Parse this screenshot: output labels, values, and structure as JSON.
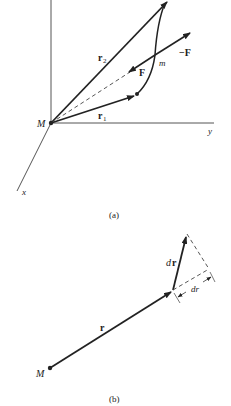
{
  "figure_a": {
    "caption": "(a)",
    "labels": {
      "origin": "M",
      "r2": "r",
      "r2_sub": "2",
      "r1": "r",
      "r1_sub": "1",
      "force_F": "F",
      "force_negF": "−F",
      "point_m": "m",
      "axis_y": "y",
      "axis_x": "x"
    }
  },
  "figure_b": {
    "caption": "(b)",
    "labels": {
      "origin": "M",
      "r": "r",
      "dr_vec_d": "d",
      "dr_vec_r": "r",
      "dr_scalar": "dr"
    }
  },
  "colors": {
    "ink": "#222222",
    "background": "#ffffff"
  }
}
